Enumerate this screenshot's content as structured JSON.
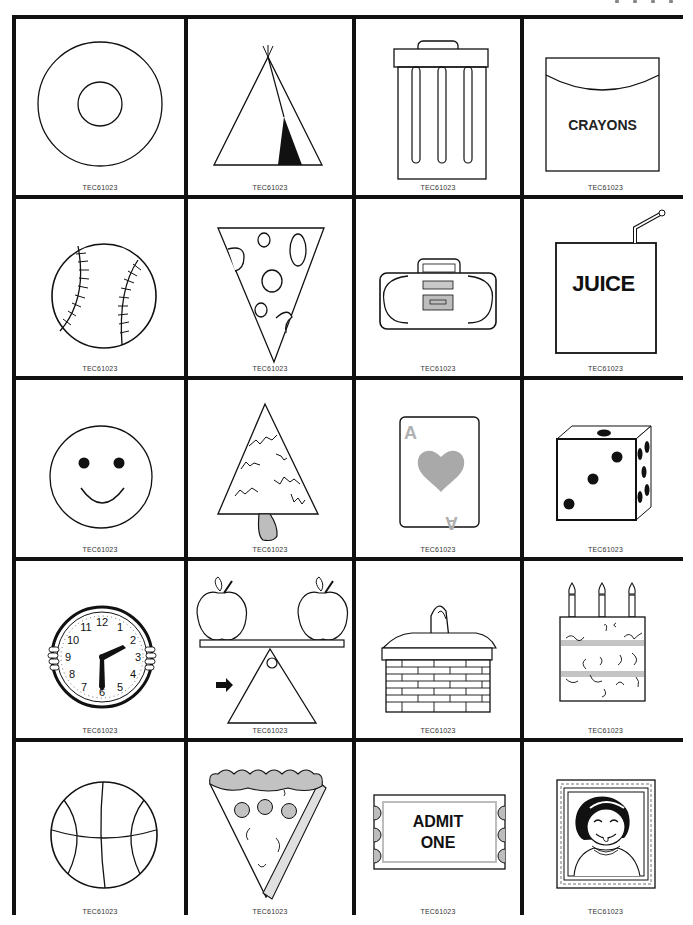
{
  "sheet": {
    "code": "TEC61023",
    "accent_gray": "#b3b3b3",
    "line_color": "#111111"
  },
  "cards": [
    {
      "name": "donut",
      "label": "",
      "code": "TEC61023"
    },
    {
      "name": "teepee",
      "label": "",
      "code": "TEC61023"
    },
    {
      "name": "trash-can",
      "label": "",
      "code": "TEC61023"
    },
    {
      "name": "crayon-box",
      "label": "CRAYONS",
      "code": "TEC61023"
    },
    {
      "name": "baseball",
      "label": "",
      "code": "TEC61023"
    },
    {
      "name": "cheese-wedge",
      "label": "",
      "code": "TEC61023"
    },
    {
      "name": "boombox",
      "label": "",
      "code": "TEC61023"
    },
    {
      "name": "juice-box",
      "label": "JUICE",
      "code": "TEC61023"
    },
    {
      "name": "smiley-face",
      "label": "",
      "code": "TEC61023"
    },
    {
      "name": "pine-tree",
      "label": "",
      "code": "TEC61023"
    },
    {
      "name": "ace-of-hearts",
      "label": "A",
      "code": "TEC61023"
    },
    {
      "name": "die",
      "label": "",
      "code": "TEC61023"
    },
    {
      "name": "clock",
      "label": "",
      "code": "TEC61023",
      "numbers": [
        "12",
        "1",
        "2",
        "3",
        "4",
        "5",
        "6",
        "7",
        "8",
        "9",
        "10",
        "11"
      ]
    },
    {
      "name": "balance-scale-apples",
      "label": "",
      "code": "TEC61023"
    },
    {
      "name": "basket",
      "label": "",
      "code": "TEC61023"
    },
    {
      "name": "birthday-cake",
      "label": "",
      "code": "TEC61023"
    },
    {
      "name": "basketball",
      "label": "",
      "code": "TEC61023"
    },
    {
      "name": "pizza-slice",
      "label": "",
      "code": "TEC61023"
    },
    {
      "name": "ticket",
      "label_line1": "ADMIT",
      "label_line2": "ONE",
      "code": "TEC61023"
    },
    {
      "name": "framed-portrait",
      "label": "",
      "code": "TEC61023"
    }
  ]
}
